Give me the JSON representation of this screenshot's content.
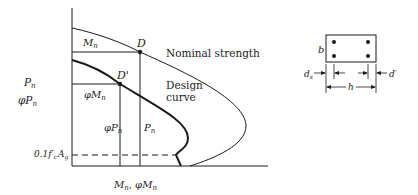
{
  "diagram": {
    "y_axis": {
      "label_1": "P",
      "label_1_sub": "n",
      "label_2": "φP",
      "label_2_sub": "n"
    },
    "x_axis": {
      "label": "M",
      "label_sub": "n",
      "sep": ", φM",
      "label2_sub": "n"
    },
    "curves": [
      {
        "name": "Nominal strength",
        "label": "Nominal strength"
      },
      {
        "name": "Design curve",
        "label_line1": "Design",
        "label_line2": "curve"
      }
    ],
    "points": [
      {
        "name": "D",
        "label": "D"
      },
      {
        "name": "D'",
        "label": "D'"
      }
    ],
    "annotations": {
      "mn": {
        "text": "M",
        "sub": "n"
      },
      "phi_mn": {
        "text": "φM",
        "sub": "n"
      },
      "phi_pn": {
        "text": "φP",
        "sub": "n"
      },
      "pn": {
        "text": "P",
        "sub": "n"
      },
      "limit": {
        "text": "0.1f′",
        "sub1": "c",
        "text2": "A",
        "sub2": "g"
      }
    },
    "section": {
      "b": "b",
      "h": "h",
      "ds": "d",
      "ds_sub": "s",
      "d_prime": "d′",
      "bars": 4
    },
    "colors": {
      "line": "#1a1a1a",
      "background": "#ffffff"
    }
  }
}
